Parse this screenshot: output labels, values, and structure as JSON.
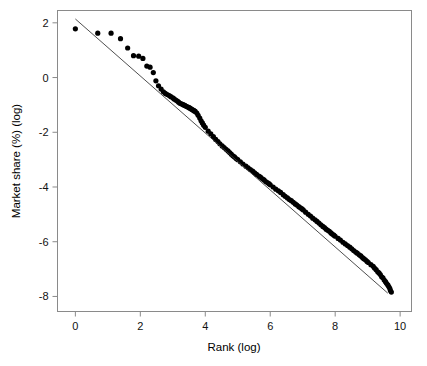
{
  "chart_data": {
    "type": "scatter",
    "title": "",
    "subtitle": "",
    "xlabel": "Rank (log)",
    "ylabel": "Market share (%) (log)",
    "xlim": [
      -0.55,
      10.35
    ],
    "ylim": [
      -8.55,
      2.45
    ],
    "xticks": [
      0,
      2,
      4,
      6,
      8,
      10
    ],
    "xticklabels": [
      "0",
      "2",
      "4",
      "6",
      "8",
      "10"
    ],
    "yticks": [
      2,
      0,
      -2,
      -4,
      -6,
      -8
    ],
    "yticklabels": [
      "2",
      "0",
      "-2",
      "-4",
      "-6",
      "-8"
    ],
    "grid": false,
    "legend": null,
    "legend_position": "none",
    "marker_color": "#000000",
    "marker_shape": "circle",
    "frame_color": "#8a8a8a",
    "background_color": "#ffffff",
    "series": [
      {
        "name": "Market share by rank",
        "type": "scatter",
        "color": "#000000",
        "x": [
          0.0,
          0.69,
          1.1,
          1.39,
          1.61,
          1.79,
          1.95,
          2.08,
          2.2,
          2.3,
          2.4,
          2.48,
          2.56,
          2.64,
          2.71,
          2.77,
          2.83,
          2.89,
          2.94,
          3.0,
          3.04,
          3.09,
          3.14,
          3.18,
          3.22,
          3.26,
          3.3,
          3.33,
          3.37,
          3.4,
          3.43,
          3.47,
          3.5,
          3.53,
          3.56,
          3.58,
          3.61,
          3.64,
          3.66,
          3.69,
          3.74,
          3.78,
          3.83,
          3.87,
          3.91,
          3.95,
          4.0,
          4.09,
          4.17,
          4.25,
          4.32,
          4.39,
          4.45,
          4.52,
          4.58,
          4.64,
          4.7,
          4.75,
          4.8,
          4.85,
          4.9,
          4.95,
          5.0,
          5.08,
          5.16,
          5.25,
          5.32,
          5.39,
          5.46,
          5.52,
          5.58,
          5.65,
          5.7,
          5.76,
          5.81,
          5.86,
          5.91,
          5.96,
          6.0,
          6.09,
          6.17,
          6.25,
          6.32,
          6.4,
          6.46,
          6.53,
          6.59,
          6.65,
          6.71,
          6.77,
          6.82,
          6.88,
          6.93,
          6.98,
          7.02,
          7.09,
          7.17,
          7.24,
          7.31,
          7.38,
          7.44,
          7.5,
          7.56,
          7.62,
          7.67,
          7.72,
          7.77,
          7.82,
          7.87,
          7.91,
          7.96,
          8.0,
          8.09,
          8.16,
          8.24,
          8.31,
          8.38,
          8.45,
          8.51,
          8.57,
          8.63,
          8.68,
          8.74,
          8.79,
          8.84,
          8.88,
          8.93,
          8.98,
          9.02,
          9.1,
          9.17,
          9.21,
          9.26,
          9.31,
          9.35,
          9.39,
          9.43,
          9.47,
          9.51,
          9.55,
          9.58,
          9.62,
          9.65,
          9.68,
          9.7,
          9.73
        ],
        "y": [
          1.78,
          1.62,
          1.62,
          1.42,
          1.08,
          0.8,
          0.78,
          0.7,
          0.42,
          0.38,
          0.18,
          -0.12,
          -0.3,
          -0.42,
          -0.52,
          -0.58,
          -0.62,
          -0.66,
          -0.7,
          -0.74,
          -0.78,
          -0.82,
          -0.86,
          -0.9,
          -0.94,
          -0.96,
          -0.98,
          -1.0,
          -1.02,
          -1.04,
          -1.06,
          -1.08,
          -1.1,
          -1.12,
          -1.14,
          -1.16,
          -1.18,
          -1.2,
          -1.22,
          -1.24,
          -1.3,
          -1.38,
          -1.48,
          -1.58,
          -1.66,
          -1.74,
          -1.82,
          -1.96,
          -2.06,
          -2.16,
          -2.26,
          -2.34,
          -2.42,
          -2.5,
          -2.56,
          -2.62,
          -2.68,
          -2.74,
          -2.8,
          -2.86,
          -2.9,
          -2.96,
          -3.0,
          -3.08,
          -3.16,
          -3.24,
          -3.3,
          -3.36,
          -3.42,
          -3.48,
          -3.54,
          -3.6,
          -3.64,
          -3.7,
          -3.74,
          -3.8,
          -3.84,
          -3.88,
          -3.92,
          -4.0,
          -4.08,
          -4.14,
          -4.2,
          -4.28,
          -4.34,
          -4.4,
          -4.46,
          -4.5,
          -4.56,
          -4.62,
          -4.66,
          -4.72,
          -4.76,
          -4.8,
          -4.84,
          -4.92,
          -5.0,
          -5.06,
          -5.14,
          -5.2,
          -5.26,
          -5.32,
          -5.38,
          -5.44,
          -5.48,
          -5.54,
          -5.58,
          -5.62,
          -5.68,
          -5.72,
          -5.76,
          -5.8,
          -5.88,
          -5.94,
          -6.02,
          -6.08,
          -6.14,
          -6.2,
          -6.26,
          -6.32,
          -6.38,
          -6.42,
          -6.48,
          -6.52,
          -6.58,
          -6.62,
          -6.66,
          -6.72,
          -6.76,
          -6.84,
          -6.9,
          -6.96,
          -7.02,
          -7.1,
          -7.14,
          -7.2,
          -7.28,
          -7.32,
          -7.4,
          -7.46,
          -7.52,
          -7.58,
          -7.64,
          -7.7,
          -7.78,
          -7.84
        ]
      }
    ],
    "fit_line": {
      "name": "linear fit",
      "type": "line",
      "color": "#3b3b3b",
      "x": [
        0.0,
        9.62
      ],
      "y": [
        2.14,
        -7.88
      ],
      "slope": -1.041,
      "intercept": 2.14
    },
    "annotations": []
  }
}
